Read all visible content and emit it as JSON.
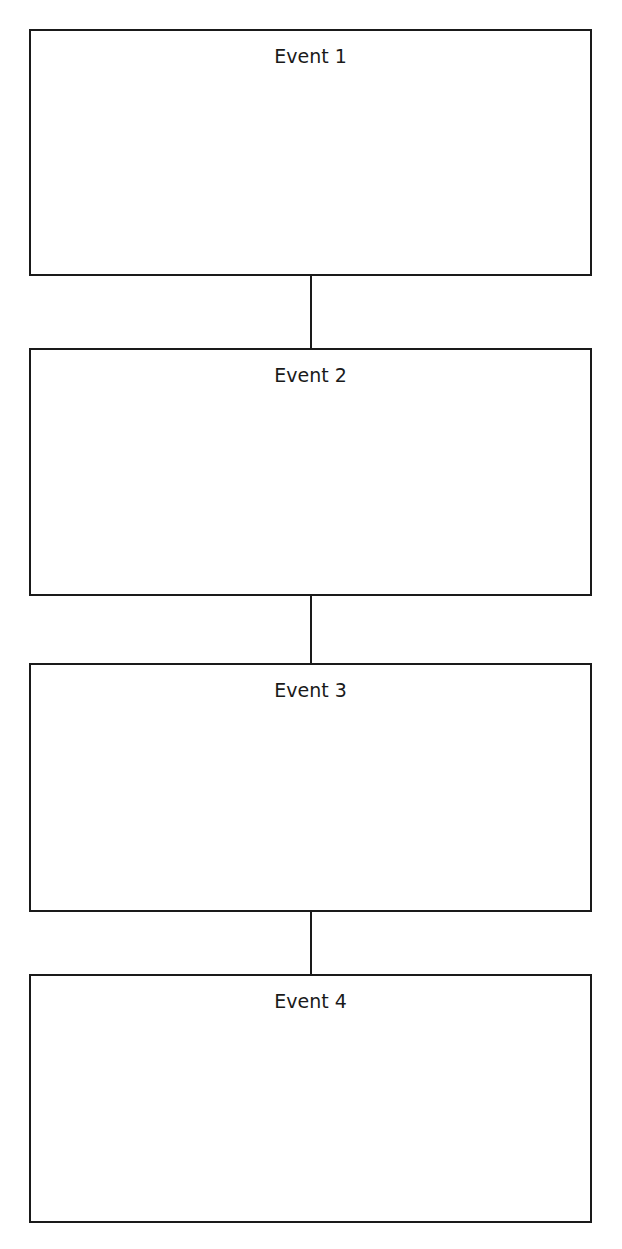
{
  "diagram": {
    "type": "vertical-timeline",
    "events": [
      {
        "label": "Event 1"
      },
      {
        "label": "Event 2"
      },
      {
        "label": "Event 3"
      },
      {
        "label": "Event 4"
      }
    ]
  }
}
